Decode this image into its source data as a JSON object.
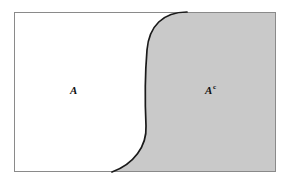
{
  "figure": {
    "kind": "set-complement-venn-diagram",
    "canvas": {
      "width": 290,
      "height": 184
    },
    "frame": {
      "name": "universal-set-rectangle",
      "x": 14,
      "y": 12,
      "width": 262,
      "height": 160,
      "stroke_color": "#8a8a8a",
      "stroke_width": 1,
      "fill_color": "#ffffff"
    },
    "regions": [
      {
        "id": "region-a",
        "label": "A",
        "superscript": "",
        "fill_color": "#ffffff",
        "label_x": 75,
        "label_y": 90,
        "side": "left"
      },
      {
        "id": "region-a-complement",
        "label": "A",
        "superscript": "c",
        "fill_color": "#c9c9c9",
        "label_x": 212,
        "label_y": 90,
        "side": "right"
      }
    ],
    "divider": {
      "name": "boundary-curve",
      "stroke_color": "#1a1a1a",
      "stroke_width": 1.7,
      "top_intersection_x": 187,
      "bottom_intersection_x": 112,
      "vertical_segment_x": 146,
      "path": "M 187 12 C 163 12 149 26 147 50 C 145 74 145 104 146 126 C 147 146 134 164 112 172"
    },
    "shaded_path": "M 187 12 C 163 12 149 26 147 50 C 145 74 145 104 146 126 C 147 146 134 164 112 172 L 276 172 L 276 12 Z"
  }
}
